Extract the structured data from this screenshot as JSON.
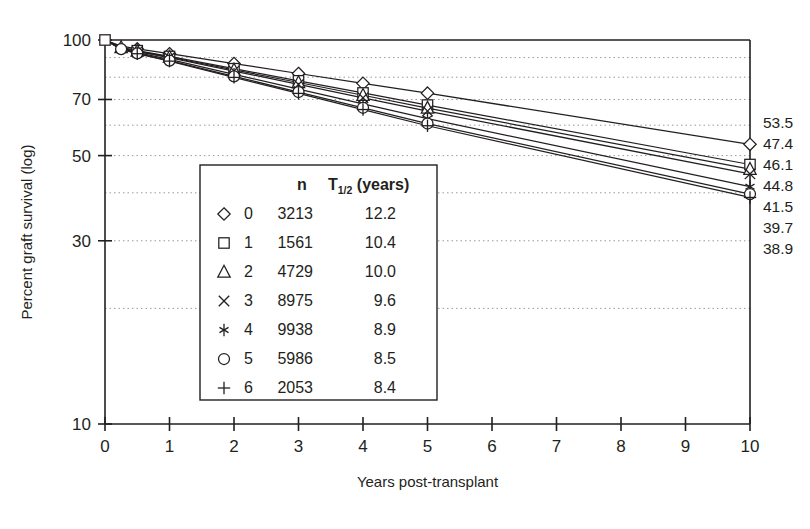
{
  "chart_data": {
    "type": "line",
    "title": "",
    "xlabel": "Years post-transplant",
    "ylabel": "Percent graft survival (log)",
    "yscale": "log",
    "ylim": [
      10,
      100
    ],
    "xlim": [
      0,
      10
    ],
    "grid": "horizontal-dotted",
    "y_ticks": [
      "100",
      "70",
      "50",
      "30",
      "10"
    ],
    "y_tick_values": [
      100,
      70,
      50,
      30,
      10
    ],
    "x_ticks": [
      "0",
      "1",
      "2",
      "3",
      "4",
      "5",
      "6",
      "7",
      "8",
      "9",
      "10"
    ],
    "x_tick_values": [
      0,
      1,
      2,
      3,
      4,
      5,
      6,
      7,
      8,
      9,
      10
    ],
    "x": [
      0,
      0.25,
      0.5,
      1,
      2,
      3,
      4,
      5,
      10
    ],
    "series": [
      {
        "name": "0",
        "marker": "diamond",
        "n": "3213",
        "half_life": "12.2",
        "end_label": "53.5",
        "values": [
          100,
          96.4,
          94.8,
          92.1,
          86.8,
          81.8,
          77.1,
          72.7,
          53.5
        ]
      },
      {
        "name": "1",
        "marker": "square",
        "n": "1561",
        "half_life": "10.4",
        "end_label": "47.4",
        "values": [
          100,
          95.7,
          93.8,
          90.6,
          84.2,
          78.3,
          72.8,
          67.7,
          47.4
        ]
      },
      {
        "name": "2",
        "marker": "triangle",
        "n": "4729",
        "half_life": "10.0",
        "end_label": "46.1",
        "values": [
          100,
          95.6,
          93.6,
          90.3,
          83.6,
          77.5,
          71.8,
          66.5,
          46.1
        ]
      },
      {
        "name": "3",
        "marker": "cross",
        "n": "8975",
        "half_life": "9.6",
        "end_label": "44.8",
        "values": [
          100,
          95.4,
          93.3,
          89.9,
          83.0,
          76.6,
          70.7,
          65.3,
          44.8
        ]
      },
      {
        "name": "4",
        "marker": "asterisk",
        "n": "9938",
        "half_life": "8.9",
        "end_label": "41.5",
        "values": [
          100,
          95.0,
          92.7,
          89.0,
          81.4,
          74.5,
          68.2,
          62.4,
          41.5
        ]
      },
      {
        "name": "5",
        "marker": "circle",
        "n": "5986",
        "half_life": "8.5",
        "end_label": "39.7",
        "values": [
          100,
          94.7,
          92.3,
          88.4,
          80.4,
          73.2,
          66.6,
          60.6,
          39.7
        ]
      },
      {
        "name": "6",
        "marker": "plus",
        "n": "2053",
        "half_life": "8.4",
        "end_label": "38.9",
        "values": [
          100,
          94.6,
          92.1,
          88.1,
          79.9,
          72.6,
          65.9,
          59.8,
          38.9
        ]
      }
    ],
    "legend": {
      "position": "inside-lower-left",
      "col_header_n": "n",
      "col_header_halflife_main": "T",
      "col_header_halflife_sub": "1/2",
      "col_header_halflife_unit": " (years)",
      "rows": [
        {
          "marker": "diamond",
          "label": "0",
          "n": "3213",
          "half_life": "12.2"
        },
        {
          "marker": "square",
          "label": "1",
          "n": "1561",
          "half_life": "10.4"
        },
        {
          "marker": "triangle",
          "label": "2",
          "n": "4729",
          "half_life": "10.0"
        },
        {
          "marker": "cross",
          "label": "3",
          "n": "8975",
          "half_life": "9.6"
        },
        {
          "marker": "asterisk",
          "label": "4",
          "n": "9938",
          "half_life": "8.9"
        },
        {
          "marker": "circle",
          "label": "5",
          "n": "5986",
          "half_life": "8.5"
        },
        {
          "marker": "plus",
          "label": "6",
          "n": "2053",
          "half_life": "8.4"
        }
      ]
    },
    "right_end_labels": [
      "53.5",
      "47.4",
      "46.1",
      "44.8",
      "41.5",
      "39.7",
      "38.9"
    ],
    "gridline_values": [
      90,
      80,
      70,
      60,
      50,
      40,
      30,
      20
    ],
    "colors": {
      "ink": "#231f20",
      "grid": "#9a9a9a",
      "background": "#ffffff"
    }
  }
}
